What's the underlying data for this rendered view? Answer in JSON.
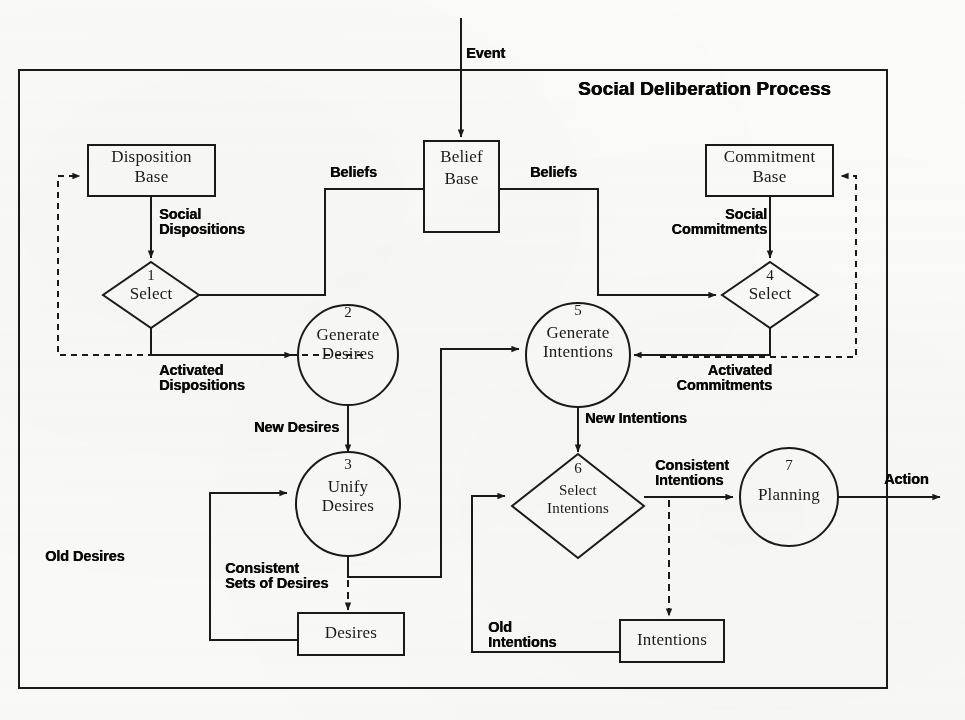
{
  "diagram": {
    "title": "Social Deliberation Process",
    "external_labels": {
      "event": "Event",
      "action": "Action"
    },
    "nodes": [
      {
        "id": "belief-base",
        "shape": "rect",
        "label": "Belief Base",
        "number": ""
      },
      {
        "id": "disposition-base",
        "shape": "rect",
        "label": "Disposition Base",
        "number": ""
      },
      {
        "id": "commitment-base",
        "shape": "rect",
        "label": "Commitment Base",
        "number": ""
      },
      {
        "id": "select-dispositions",
        "shape": "diamond",
        "label": "Select",
        "number": "1"
      },
      {
        "id": "generate-desires",
        "shape": "circle",
        "label": "Generate Desires",
        "number": "2"
      },
      {
        "id": "unify-desires",
        "shape": "circle",
        "label": "Unify Desires",
        "number": "3"
      },
      {
        "id": "select-commitments",
        "shape": "diamond",
        "label": "Select",
        "number": "4"
      },
      {
        "id": "generate-intentions",
        "shape": "circle",
        "label": "Generate Intentions",
        "number": "5"
      },
      {
        "id": "select-intentions",
        "shape": "diamond",
        "label": "Select Intentions",
        "number": "6"
      },
      {
        "id": "planning",
        "shape": "circle",
        "label": "Planning",
        "number": "7"
      },
      {
        "id": "desires-store",
        "shape": "rect",
        "label": "Desires",
        "number": ""
      },
      {
        "id": "intentions-store",
        "shape": "rect",
        "label": "Intentions",
        "number": ""
      }
    ],
    "node_text": {
      "belief_base_l1": "Belief",
      "belief_base_l2": "Base",
      "disposition_base_l1": "Disposition",
      "disposition_base_l2": "Base",
      "commitment_base_l1": "Commitment",
      "commitment_base_l2": "Base",
      "select_1": "Select",
      "num_1": "1",
      "generate_desires_l1": "Generate",
      "generate_desires_l2": "Desires",
      "num_2": "2",
      "unify_desires_l1": "Unify",
      "unify_desires_l2": "Desires",
      "num_3": "3",
      "select_4": "Select",
      "num_4": "4",
      "generate_intentions_l1": "Generate",
      "generate_intentions_l2": "Intentions",
      "num_5": "5",
      "select_intentions_l1": "Select",
      "select_intentions_l2": "Intentions",
      "num_6": "6",
      "planning": "Planning",
      "num_7": "7",
      "desires_store": "Desires",
      "intentions_store": "Intentions"
    },
    "edge_labels": {
      "beliefs_left": "Beliefs",
      "beliefs_right": "Beliefs",
      "social_dispositions_l1": "Social",
      "social_dispositions_l2": "Dispositions",
      "social_commitments_l1": "Social",
      "social_commitments_l2": "Commitments",
      "activated_dispositions_l1": "Activated",
      "activated_dispositions_l2": "Dispositions",
      "activated_commitments_l1": "Activated",
      "activated_commitments_l2": "Commitments",
      "new_desires": "New Desires",
      "new_intentions": "New Intentions",
      "old_desires": "Old Desires",
      "old_intentions_l1": "Old",
      "old_intentions_l2": "Intentions",
      "consistent_sets_of_desires_l1": "Consistent",
      "consistent_sets_of_desires_l2": "Sets of Desires",
      "consistent_intentions_l1": "Consistent",
      "consistent_intentions_l2": "Intentions"
    },
    "colors": {
      "stroke": "#1a1a1a",
      "background": "#fbfbfa",
      "text": "#141414"
    }
  }
}
